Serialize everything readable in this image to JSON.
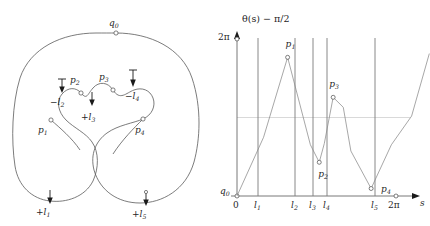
{
  "figure": {
    "title_left": "",
    "panels": [
      "curve-diagram",
      "theta-plot"
    ]
  },
  "left_diagram": {
    "name": "immersed-curve-with-turning-points",
    "point_labels": [
      {
        "id": "q0",
        "text": "q",
        "sub": "0",
        "x": 116,
        "y": 26,
        "mx": 116,
        "my": 33
      },
      {
        "id": "p1",
        "text": "p",
        "sub": "1",
        "x": 43,
        "y": 132,
        "mx": 51,
        "my": 120
      },
      {
        "id": "p2",
        "text": "p",
        "sub": "2",
        "x": 75,
        "y": 83,
        "mx": 81,
        "my": 93
      },
      {
        "id": "p3",
        "text": "p",
        "sub": "3",
        "x": 105,
        "y": 80,
        "mx": 113,
        "my": 90
      },
      {
        "id": "p4",
        "text": "p",
        "sub": "4",
        "x": 140,
        "y": 131,
        "mx": 143,
        "my": 119
      }
    ],
    "arrow_labels": [
      {
        "id": "l1",
        "sign": "+",
        "text": "l",
        "sub": "1",
        "x": 42,
        "y": 211
      },
      {
        "id": "l2",
        "sign": "−",
        "text": "l",
        "sub": "2",
        "x": 56,
        "y": 101
      },
      {
        "id": "l3",
        "sign": "+",
        "text": "l",
        "sub": "3",
        "x": 88,
        "y": 116
      },
      {
        "id": "l4",
        "sign": "−",
        "text": "l",
        "sub": "4",
        "x": 131,
        "y": 95
      },
      {
        "id": "l5",
        "sign": "+",
        "text": "l",
        "sub": "5",
        "x": 138,
        "y": 211
      }
    ]
  },
  "chart_data": {
    "type": "line",
    "title": "θ(s) − π/2",
    "xlabel": "s",
    "ylabel": "",
    "xlim_labels": [
      "0",
      "l1",
      "l2",
      "l3",
      "l4",
      "l5",
      "2π"
    ],
    "ytick_labels": [
      "2π"
    ],
    "grid": "horizontal-midline-only",
    "legend": "none",
    "x_ticks": [
      {
        "label": "0",
        "sub": "",
        "value": 0.0
      },
      {
        "label": "l",
        "sub": "1",
        "value": 1.05
      },
      {
        "label": "l",
        "sub": "2",
        "value": 2.9
      },
      {
        "label": "l",
        "sub": "3",
        "value": 3.8
      },
      {
        "label": "l",
        "sub": "4",
        "value": 4.5
      },
      {
        "label": "l",
        "sub": "5",
        "value": 6.9
      },
      {
        "label": "2π",
        "sub": "",
        "value": 7.95
      }
    ],
    "vertical_lines_at": [
      "l1",
      "l2",
      "l3",
      "l4",
      "l5"
    ],
    "midline_value": 3.1416,
    "ylim": [
      0,
      6.2832
    ],
    "series": [
      {
        "name": "theta(s) - pi/2",
        "x": [
          0.0,
          1.05,
          2.0,
          2.9,
          3.25,
          3.45,
          3.8,
          4.2,
          4.5,
          5.3,
          6.1,
          6.9,
          7.6
        ],
        "y": [
          0.0,
          2.35,
          5.55,
          2.05,
          1.35,
          2.1,
          3.95,
          3.55,
          1.8,
          0.3,
          2.05,
          3.2,
          5.7
        ]
      }
    ],
    "annotated_points": [
      {
        "label": "p",
        "sub": "1",
        "x": 2.0,
        "y": 5.55,
        "label_dx": -2,
        "label_dy": -10
      },
      {
        "label": "p",
        "sub": "2",
        "x": 3.25,
        "y": 1.35,
        "label_dx": -1,
        "label_dy": 15
      },
      {
        "label": "p",
        "sub": "3",
        "x": 3.8,
        "y": 3.95,
        "label_dx": -4,
        "label_dy": -10
      },
      {
        "label": "p",
        "sub": "4",
        "x": 5.3,
        "y": 0.3,
        "label_dx": 10,
        "label_dy": 3
      }
    ],
    "origin_label": {
      "label": "q",
      "sub": "0"
    },
    "axis_end_markers": [
      "2pi-on-x-axis",
      "2pi-on-y-axis"
    ]
  }
}
